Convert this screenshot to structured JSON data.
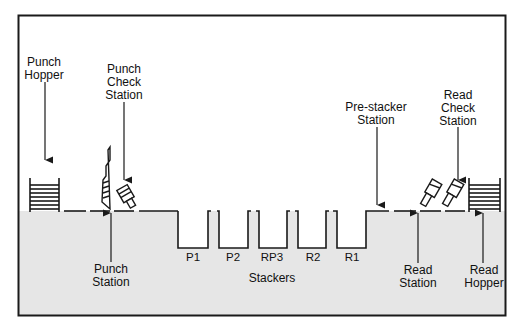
{
  "diagram": {
    "colors": {
      "background": "#ffffff",
      "lower_fill": "#e6e6e6",
      "line": "#1a1a1a"
    },
    "labels": {
      "punch_hopper": [
        "Punch",
        "Hopper"
      ],
      "punch_check_station": [
        "Punch",
        "Check",
        "Station"
      ],
      "pre_stacker_station": [
        "Pre-stacker",
        "Station"
      ],
      "read_check_station": [
        "Read",
        "Check",
        "Station"
      ],
      "punch_station": [
        "Punch",
        "Station"
      ],
      "read_station": [
        "Read",
        "Station"
      ],
      "read_hopper": [
        "Read",
        "Hopper"
      ],
      "stackers_title": "Stackers"
    },
    "stackers": [
      "P1",
      "P2",
      "RP3",
      "R2",
      "R1"
    ]
  }
}
